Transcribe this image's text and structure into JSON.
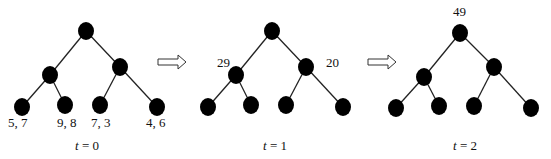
{
  "diagram": {
    "type": "tree-sequence",
    "edge_color": "#222222",
    "node_color": "#000000",
    "panels": [
      {
        "time_label_var": "t",
        "time_label_eq": "= 0",
        "offset_x": 0,
        "node_labels": {
          "leaf0": "5, 7",
          "leaf1": "9, 8",
          "leaf2": "7, 3",
          "leaf3": "4, 6"
        }
      },
      {
        "time_label_var": "t",
        "time_label_eq": "= 1",
        "offset_x": 186,
        "node_labels": {
          "mid_left": "29",
          "mid_right": "20"
        }
      },
      {
        "time_label_var": "t",
        "time_label_eq": "= 2",
        "offset_x": 372,
        "node_labels": {
          "root": "49"
        }
      }
    ],
    "arrows": [
      {
        "name": "arrow-t0-to-t1",
        "x": 158,
        "y": 62
      },
      {
        "name": "arrow-t1-to-t2",
        "x": 368,
        "y": 62
      }
    ]
  }
}
